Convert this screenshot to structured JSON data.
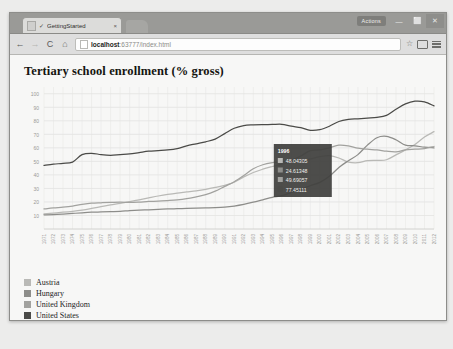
{
  "window": {
    "actions_label": "Actions",
    "minimize": "—",
    "maximize": "⬜",
    "close": "✕"
  },
  "tab": {
    "title": "GettingStarted",
    "check": "✓",
    "close": "×",
    "favicon_name": "page-favicon"
  },
  "toolbar": {
    "back": "←",
    "forward": "→",
    "reload": "C",
    "home": "⌂",
    "url_host": "localhost",
    "url_rest": ":63777/index.html",
    "star": "☆",
    "menu_lines": 3
  },
  "chart_data": {
    "type": "line",
    "title": "Tertiary school enrollment (% gross)",
    "xlabel": "",
    "ylabel": "",
    "ylim": [
      0,
      105
    ],
    "yticks": [
      10,
      20,
      30,
      40,
      50,
      60,
      70,
      80,
      90,
      100
    ],
    "grid": true,
    "legend_position": "below-left",
    "x": [
      1971,
      1972,
      1973,
      1974,
      1975,
      1976,
      1977,
      1978,
      1979,
      1980,
      1981,
      1982,
      1983,
      1984,
      1985,
      1986,
      1987,
      1988,
      1989,
      1990,
      1991,
      1992,
      1993,
      1994,
      1995,
      1996,
      1997,
      1998,
      1999,
      2000,
      2001,
      2002,
      2003,
      2004,
      2005,
      2006,
      2007,
      2008,
      2009,
      2010,
      2011,
      2012
    ],
    "xticks": [
      "1971",
      "1972",
      "1973",
      "1974",
      "1975",
      "1976",
      "1977",
      "1978",
      "1979",
      "1980",
      "1981",
      "1982",
      "1983",
      "1984",
      "1985",
      "1986",
      "1987",
      "1988",
      "1989",
      "1990",
      "1991",
      "1992",
      "1993",
      "1994",
      "1995",
      "1996",
      "1997",
      "1998",
      "1999",
      "2000",
      "2001",
      "2002",
      "2003",
      "2004",
      "2005",
      "2006",
      "2007",
      "2008",
      "2009",
      "2010",
      "2011",
      "2012"
    ],
    "series": [
      {
        "name": "Austria",
        "color": "#b9b9b6",
        "values": [
          11.2,
          11.8,
          12.4,
          13.1,
          14.0,
          15.2,
          16.5,
          17.8,
          18.9,
          20.2,
          21.6,
          23.0,
          24.4,
          25.6,
          26.6,
          27.4,
          28.2,
          29.3,
          30.7,
          32.3,
          34.6,
          38.5,
          41.8,
          44.2,
          46.2,
          48.04305,
          49.0,
          50.2,
          51.8,
          53.5,
          54.2,
          52.5,
          49.5,
          49.0,
          50.5,
          50.8,
          51.2,
          54.8,
          58.5,
          62.5,
          68.0,
          72.0
        ]
      },
      {
        "name": "Hungary",
        "color": "#8d8d8a",
        "values": [
          10.5,
          10.6,
          11.0,
          11.5,
          12.0,
          12.4,
          12.6,
          12.8,
          13.0,
          13.6,
          14.0,
          14.2,
          14.5,
          14.8,
          15.0,
          15.2,
          15.4,
          15.6,
          15.8,
          16.2,
          17.0,
          18.2,
          19.8,
          21.6,
          23.4,
          24.61348,
          27.0,
          29.5,
          32.0,
          34.5,
          39.0,
          45.5,
          50.5,
          55.0,
          62.0,
          67.5,
          68.5,
          66.0,
          62.0,
          61.5,
          60.5,
          60.0
        ]
      },
      {
        "name": "United Kingdom",
        "color": "#a2a29f",
        "values": [
          14.8,
          15.6,
          16.2,
          17.0,
          18.2,
          19.1,
          19.4,
          19.6,
          19.8,
          19.6,
          19.9,
          20.4,
          20.6,
          21.0,
          21.5,
          22.4,
          23.8,
          25.4,
          28.0,
          31.5,
          35.0,
          39.5,
          44.5,
          47.5,
          49.0,
          49.69057,
          51.0,
          54.0,
          58.0,
          58.5,
          60.0,
          62.0,
          61.5,
          59.8,
          59.0,
          58.5,
          57.5,
          57.0,
          58.5,
          59.0,
          59.5,
          61.0
        ]
      },
      {
        "name": "United States",
        "color": "#4b4b48",
        "values": [
          47.0,
          48.0,
          48.5,
          49.5,
          55.0,
          56.0,
          55.0,
          54.5,
          55.0,
          55.5,
          56.5,
          57.5,
          58.0,
          58.5,
          59.5,
          61.5,
          63.0,
          64.5,
          66.5,
          70.5,
          74.5,
          76.5,
          77.0,
          77.2,
          77.3,
          77.45111,
          76.0,
          75.0,
          73.0,
          73.5,
          76.0,
          79.5,
          81.0,
          81.5,
          82.0,
          82.5,
          84.0,
          88.5,
          92.5,
          94.5,
          94.0,
          91.0
        ]
      }
    ],
    "tooltip": {
      "visible": true,
      "header": "1996",
      "rows": [
        {
          "color": "#b9b9b6",
          "value": "48.04305"
        },
        {
          "color": "#8d8d8a",
          "value": "24.61348"
        },
        {
          "color": "#a2a29f",
          "value": "49.69057"
        },
        {
          "color": "#4b4b48",
          "value": "77.45111"
        }
      ]
    }
  }
}
